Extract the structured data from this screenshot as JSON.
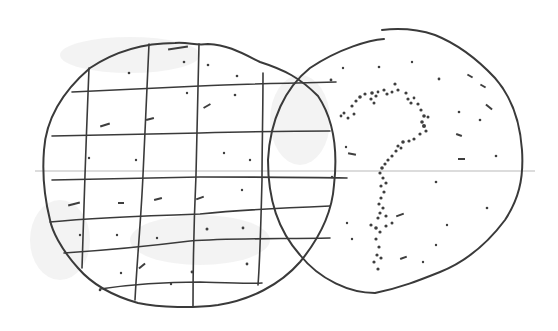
{
  "figure": {
    "colors": {
      "ink": "#3a3a3a",
      "background": "#ffffff",
      "rule_line": "#b9b9b9",
      "smudge": "#e9e9e9"
    },
    "left_circle": {
      "label": "grid-circle",
      "center": [
        188,
        175
      ],
      "radius_x": 145,
      "radius_y": 132,
      "grid_vertical_x": [
        87,
        145,
        197,
        262,
        330
      ],
      "grid_horizontal_y": [
        92,
        137,
        180,
        215,
        248,
        282
      ]
    },
    "right_circle": {
      "label": "question-mark-circle",
      "center": [
        396,
        165
      ],
      "radius_x": 128,
      "radius_y": 134,
      "symbol": "?"
    },
    "rule_line_y": 171
  }
}
